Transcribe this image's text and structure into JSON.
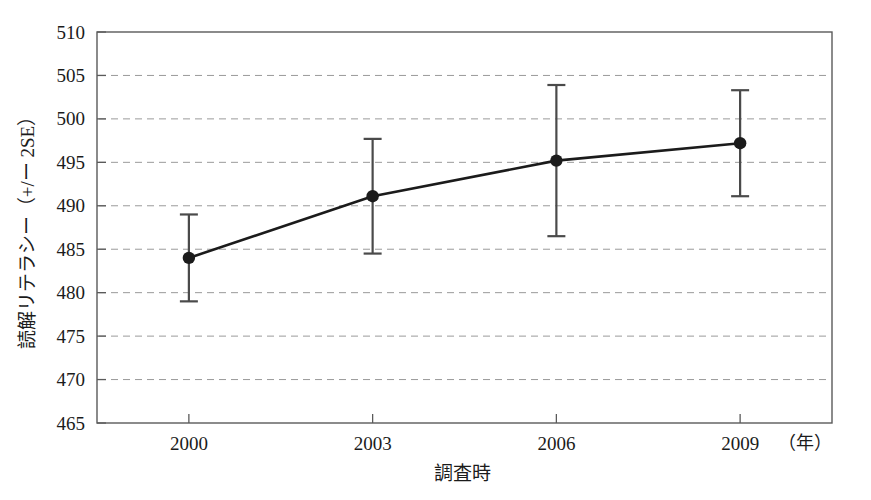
{
  "chart_data": {
    "type": "line",
    "title": "",
    "xlabel": "調査時",
    "ylabel": "読解リテラシー（+/ー 2SE）",
    "x_unit_label": "（年）",
    "categories": [
      "2000",
      "2003",
      "2006",
      "2009"
    ],
    "x": [
      2000,
      2003,
      2006,
      2009
    ],
    "values": [
      484.0,
      491.1,
      495.2,
      497.2
    ],
    "errors_2se": [
      5.0,
      6.6,
      8.7,
      6.1
    ],
    "lower_bounds": [
      479.0,
      484.5,
      486.5,
      491.1
    ],
    "upper_bounds": [
      489.0,
      497.7,
      503.9,
      503.3
    ],
    "series": [
      {
        "name": "読解リテラシー",
        "values": [
          484.0,
          491.1,
          495.2,
          497.2
        ],
        "error_bars": [
          5.0,
          6.6,
          8.7,
          6.1
        ]
      }
    ],
    "ylim": [
      465,
      510
    ],
    "yticks": [
      465,
      470,
      475,
      480,
      485,
      490,
      495,
      500,
      505,
      510
    ],
    "ytick_labels": [
      "465",
      "470",
      "475",
      "480",
      "485",
      "490",
      "495",
      "500",
      "505",
      "510"
    ],
    "xtick_labels": [
      "2000",
      "2003",
      "2006",
      "2009"
    ],
    "grid": true,
    "grid_style": "dashed-horizontal",
    "legend": "none",
    "marker": "filled-circle",
    "line_color": "#1b1b1b",
    "grid_color": "#9a9a9a",
    "axis_color": "#5a5a5a",
    "background": "#ffffff"
  }
}
